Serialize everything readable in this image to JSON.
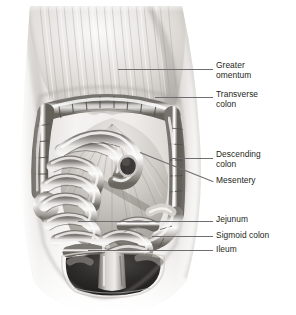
{
  "figure": {
    "style": "grayscale medical illustration",
    "background_color": "#ffffff",
    "label_color": "#231f20",
    "leader_line_color": "#6e6e70",
    "torso_fill": "#e8e6e3",
    "cavity_dark": "#2b2b2d",
    "organ_light": "#f2f0ee",
    "organ_mid": "#b9b6b2",
    "organ_dark": "#6a6764"
  },
  "labels": [
    {
      "id": "greater-omentum",
      "text": "Greater\nomentum",
      "text_x": 216,
      "text_y": 61,
      "leader": {
        "x1": 118,
        "y1": 69,
        "x2": 213,
        "y2": 69
      }
    },
    {
      "id": "transverse-colon",
      "text": "Transverse\ncolon",
      "text_x": 216,
      "text_y": 90,
      "leader": {
        "x1": 155,
        "y1": 97,
        "x2": 213,
        "y2": 97
      }
    },
    {
      "id": "descending-colon",
      "text": "Descending\ncolon",
      "text_x": 216,
      "text_y": 150,
      "leader": {
        "x1": 172,
        "y1": 158,
        "x2": 213,
        "y2": 158
      }
    },
    {
      "id": "mesentery",
      "text": "Mesentery",
      "text_x": 216,
      "text_y": 176,
      "leader": {
        "x1": 140,
        "y1": 152,
        "x2": 213,
        "y2": 181
      }
    },
    {
      "id": "jejunum",
      "text": "Jejunum",
      "text_x": 216,
      "text_y": 215,
      "leader": {
        "x1": 78,
        "y1": 221,
        "x2": 213,
        "y2": 221
      }
    },
    {
      "id": "sigmoid-colon",
      "text": "Sigmoid colon",
      "text_x": 216,
      "text_y": 231,
      "leader": {
        "x1": 152,
        "y1": 236,
        "x2": 213,
        "y2": 236
      }
    },
    {
      "id": "ileum",
      "text": "Ileum",
      "text_x": 216,
      "text_y": 245,
      "leader": {
        "x1": 88,
        "y1": 250,
        "x2": 213,
        "y2": 250
      }
    }
  ]
}
